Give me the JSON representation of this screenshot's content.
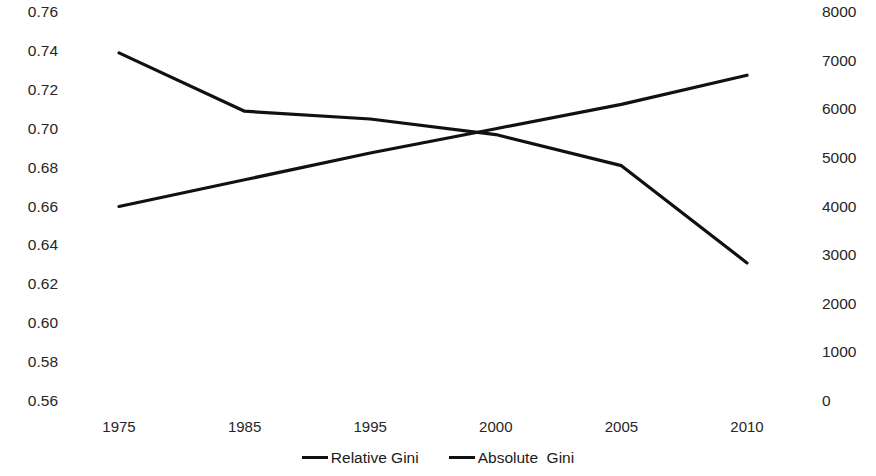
{
  "chart_data": {
    "type": "line",
    "title": "",
    "subtitle": "",
    "xlabel": "",
    "ylabel": "",
    "grid": false,
    "legend_position": "bottom-center",
    "categories": [
      "1975",
      "1985",
      "1995",
      "2000",
      "2005",
      "2010"
    ],
    "axes": {
      "left": {
        "name": "Relative Gini",
        "ylim": [
          0.56,
          0.76
        ],
        "tick_step": 0.02,
        "ticks": [
          "0.76",
          "0.74",
          "0.72",
          "0.70",
          "0.68",
          "0.66",
          "0.64",
          "0.62",
          "0.60",
          "0.58",
          "0.56"
        ],
        "tick_values": [
          0.76,
          0.74,
          0.72,
          0.7,
          0.68,
          0.66,
          0.64,
          0.62,
          0.6,
          0.58,
          0.56
        ]
      },
      "right": {
        "name": "Absolute Gini",
        "ylim": [
          0,
          8000
        ],
        "tick_step": 1000,
        "ticks": [
          "8000",
          "7000",
          "6000",
          "5000",
          "4000",
          "3000",
          "2000",
          "1000",
          "0"
        ],
        "tick_values": [
          8000,
          7000,
          6000,
          5000,
          4000,
          3000,
          2000,
          1000,
          0
        ]
      }
    },
    "series": [
      {
        "name": "Relative Gini",
        "axis": "left",
        "color": "#111111",
        "values": [
          0.739,
          0.709,
          0.705,
          0.697,
          0.681,
          0.631
        ]
      },
      {
        "name": "Absolute Gini",
        "axis": "right",
        "color": "#111111",
        "values": [
          4000,
          4550,
          5100,
          5600,
          6100,
          6700
        ]
      }
    ]
  },
  "legend": {
    "items": [
      {
        "label": "Relative Gini",
        "color": "#111111"
      },
      {
        "label": "Absolute  Gini",
        "color": "#111111"
      }
    ]
  }
}
